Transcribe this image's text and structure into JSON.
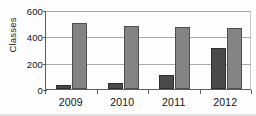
{
  "chart_data": {
    "type": "bar",
    "title": "",
    "subtitle": "",
    "xlabel": "",
    "ylabel": "Classes",
    "categories": [
      "2009",
      "2010",
      "2011",
      "2012"
    ],
    "series": [
      {
        "name": "series-1",
        "values": [
          30,
          45,
          108,
          308
        ],
        "color": "#4a4a4a"
      },
      {
        "name": "series-2",
        "values": [
          500,
          475,
          468,
          460
        ],
        "color": "#848484"
      }
    ],
    "ylim": [
      0,
      600
    ],
    "yticks": [
      0,
      200,
      400,
      600
    ],
    "ytick_labels": [
      "0",
      "200",
      "400",
      "600"
    ],
    "grid": true,
    "grid_axis": "y",
    "legend": false,
    "legend_position": "none",
    "grouped": true,
    "annotations": []
  },
  "axis": {
    "y_title": "Classes"
  }
}
